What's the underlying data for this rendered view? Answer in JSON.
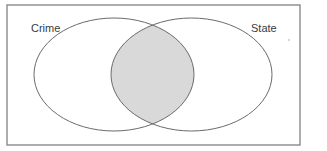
{
  "diagram": {
    "type": "venn",
    "sets": [
      {
        "id": "crime",
        "label": "Crime"
      },
      {
        "id": "state",
        "label": "State"
      }
    ],
    "highlighted_region": "Crime ∩ State",
    "colors": {
      "background": "#ffffff",
      "frame": "#8a8a8a",
      "outline": "#6a6a6a",
      "intersection_fill": "#d9d9d9",
      "label_text": "#3a3a3a"
    }
  },
  "labels": {
    "left_set": "Crime",
    "right_set": "State"
  }
}
